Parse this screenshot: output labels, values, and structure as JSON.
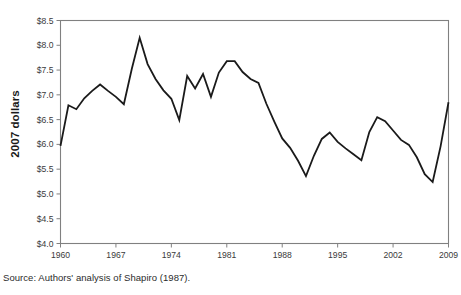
{
  "figure": {
    "source_note": "Source: Authors' analysis of Shapiro (1987).",
    "axis_color": "#808080",
    "line_color": "#1a1a1a",
    "background": "#ffffff"
  },
  "chart_data": {
    "type": "line",
    "title": "",
    "xlabel": "",
    "ylabel": "2007 dollars",
    "xlim": [
      1960,
      2009
    ],
    "ylim": [
      4.0,
      8.5
    ],
    "grid": false,
    "legend": false,
    "x_ticks": [
      "1960",
      "1967",
      "1974",
      "1981",
      "1988",
      "1995",
      "2002",
      "2009"
    ],
    "x_tick_values": [
      1960,
      1967,
      1974,
      1981,
      1988,
      1995,
      2002,
      2009
    ],
    "y_ticks": [
      "$4.0",
      "$4.5",
      "$5.0",
      "$5.5",
      "$6.0",
      "$6.5",
      "$7.0",
      "$7.5",
      "$8.0",
      "$8.5"
    ],
    "y_tick_values": [
      4.0,
      4.5,
      5.0,
      5.5,
      6.0,
      6.5,
      7.0,
      7.5,
      8.0,
      8.5
    ],
    "x": [
      1960,
      1961,
      1962,
      1963,
      1964,
      1965,
      1966,
      1967,
      1968,
      1969,
      1970,
      1971,
      1972,
      1973,
      1974,
      1975,
      1976,
      1977,
      1978,
      1979,
      1980,
      1981,
      1982,
      1983,
      1984,
      1985,
      1986,
      1987,
      1988,
      1989,
      1990,
      1991,
      1992,
      1993,
      1994,
      1995,
      1996,
      1997,
      1998,
      1999,
      2000,
      2001,
      2002,
      2003,
      2004,
      2005,
      2006,
      2007,
      2008,
      2009
    ],
    "values": [
      5.97,
      6.79,
      6.71,
      6.93,
      7.08,
      7.21,
      7.08,
      6.96,
      6.81,
      7.52,
      8.15,
      7.62,
      7.32,
      7.09,
      6.92,
      6.49,
      7.38,
      7.13,
      7.42,
      6.96,
      7.45,
      7.68,
      7.68,
      7.46,
      7.32,
      7.24,
      6.82,
      6.46,
      6.12,
      5.93,
      5.67,
      5.36,
      5.77,
      6.11,
      6.24,
      6.05,
      5.92,
      5.8,
      5.68,
      6.25,
      6.55,
      6.47,
      6.28,
      6.09,
      5.99,
      5.74,
      5.4,
      5.24,
      5.96,
      6.85
    ],
    "series": [
      {
        "name": "Real minimum wage (2007 dollars)",
        "values": [
          5.97,
          6.79,
          6.71,
          6.93,
          7.08,
          7.21,
          7.08,
          6.96,
          6.81,
          7.52,
          8.15,
          7.62,
          7.32,
          7.09,
          6.92,
          6.49,
          7.38,
          7.13,
          7.42,
          6.96,
          7.45,
          7.68,
          7.68,
          7.46,
          7.32,
          7.24,
          6.82,
          6.46,
          6.12,
          5.93,
          5.67,
          5.36,
          5.77,
          6.11,
          6.24,
          6.05,
          5.92,
          5.8,
          5.68,
          6.25,
          6.55,
          6.47,
          6.28,
          6.09,
          5.99,
          5.74,
          5.4,
          5.24,
          5.96,
          6.85
        ]
      }
    ]
  }
}
